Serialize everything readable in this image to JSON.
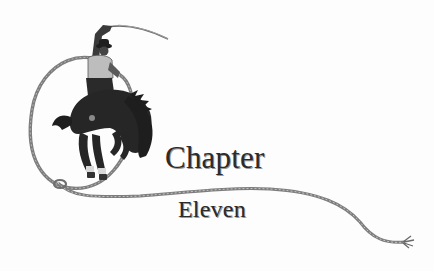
{
  "heading": {
    "line1": "Chapter",
    "line2": "Eleven"
  },
  "illustration": {
    "subject": "bronc-rider-with-lasso-icon",
    "rope_color": "#8a8a8a",
    "figure_color": "#262626"
  }
}
